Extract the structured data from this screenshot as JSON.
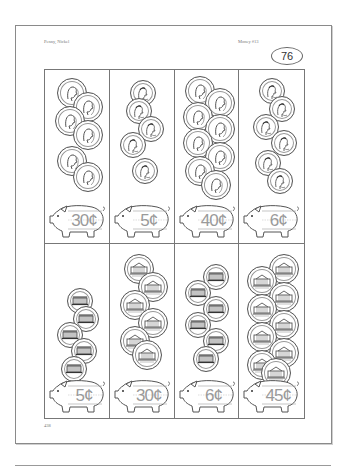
{
  "header": {
    "topic": "Penny, Nickel",
    "series": "Money #13",
    "worksheet_number": "76"
  },
  "footer": {
    "page_number": "438"
  },
  "grid": {
    "rows": 2,
    "columns": 4,
    "cells": [
      {
        "coin_type": "nickel",
        "face": "jefferson",
        "count": 6,
        "price": "30¢"
      },
      {
        "coin_type": "penny",
        "face": "lincoln",
        "count": 5,
        "price": "5¢"
      },
      {
        "coin_type": "nickel",
        "face": "jefferson",
        "count": 8,
        "price": "40¢"
      },
      {
        "coin_type": "penny",
        "face": "lincoln",
        "count": 6,
        "price": "6¢"
      },
      {
        "coin_type": "penny",
        "face": "memorial",
        "count": 5,
        "price": "5¢"
      },
      {
        "coin_type": "nickel",
        "face": "monticello",
        "count": 6,
        "price": "30¢"
      },
      {
        "coin_type": "penny",
        "face": "memorial",
        "count": 6,
        "price": "6¢"
      },
      {
        "coin_type": "nickel",
        "face": "monticello",
        "count": 9,
        "price": "45¢"
      }
    ]
  },
  "icons": {
    "coin": "coin-icon",
    "piggy_bank": "piggy-bank-icon"
  },
  "colors": {
    "line": "#777777",
    "price_text": "#9a9a9a",
    "header_text": "#777777"
  }
}
